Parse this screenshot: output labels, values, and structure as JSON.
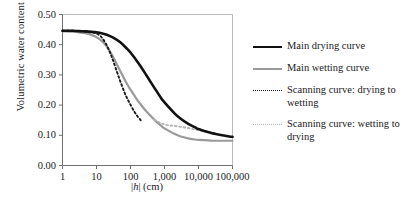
{
  "chart_data": {
    "type": "line",
    "title": "",
    "xlabel": "|h| (cm)",
    "ylabel": "Volumetric water content (–)",
    "x_scale": "log",
    "xlim": [
      1,
      100000
    ],
    "ylim": [
      0.0,
      0.5
    ],
    "grid": false,
    "legend_position": "right",
    "x_ticks": [
      "1",
      "10",
      "100",
      "1,000",
      "10,000",
      "100,000"
    ],
    "x_tick_values": [
      1,
      10,
      100,
      1000,
      10000,
      100000
    ],
    "y_ticks": [
      "0.00",
      "0.10",
      "0.20",
      "0.30",
      "0.40",
      "0.50"
    ],
    "y_tick_values": [
      0.0,
      0.1,
      0.2,
      0.3,
      0.4,
      0.5
    ],
    "series": [
      {
        "name": "Main drying curve",
        "style": "solid",
        "color": "#111111",
        "width": 2.6,
        "x": [
          1,
          2,
          3,
          5,
          8,
          10,
          15,
          20,
          30,
          50,
          80,
          100,
          150,
          200,
          300,
          500,
          800,
          1000,
          2000,
          3000,
          5000,
          8000,
          10000,
          20000,
          30000,
          50000,
          80000,
          100000
        ],
        "y": [
          0.446,
          0.446,
          0.445,
          0.444,
          0.442,
          0.441,
          0.437,
          0.433,
          0.424,
          0.408,
          0.386,
          0.374,
          0.348,
          0.328,
          0.297,
          0.258,
          0.223,
          0.209,
          0.172,
          0.155,
          0.138,
          0.126,
          0.121,
          0.11,
          0.105,
          0.1,
          0.096,
          0.095
        ]
      },
      {
        "name": "Main wetting curve",
        "style": "solid",
        "color": "#9a9a9a",
        "width": 2.2,
        "x": [
          1,
          2,
          3,
          5,
          8,
          10,
          15,
          20,
          30,
          50,
          80,
          100,
          150,
          200,
          300,
          500,
          800,
          1000,
          2000,
          3000,
          5000,
          8000,
          10000,
          20000,
          30000,
          50000,
          80000,
          100000
        ],
        "y": [
          0.444,
          0.443,
          0.441,
          0.437,
          0.43,
          0.425,
          0.41,
          0.394,
          0.362,
          0.313,
          0.269,
          0.251,
          0.221,
          0.202,
          0.178,
          0.152,
          0.131,
          0.123,
          0.104,
          0.096,
          0.09,
          0.086,
          0.085,
          0.083,
          0.082,
          0.082,
          0.082,
          0.082
        ]
      },
      {
        "name": "Scanning curve: drying to wetting",
        "style": "dotted",
        "color": "#1a1a1a",
        "width": 1.9,
        "x": [
          1,
          2,
          3,
          5,
          8,
          10,
          12,
          15,
          20,
          25,
          30,
          40,
          50,
          65,
          80,
          100,
          130,
          160,
          200
        ],
        "y": [
          0.446,
          0.446,
          0.445,
          0.443,
          0.44,
          0.437,
          0.432,
          0.421,
          0.398,
          0.374,
          0.351,
          0.31,
          0.279,
          0.245,
          0.222,
          0.201,
          0.178,
          0.163,
          0.15
        ]
      },
      {
        "name": "Scanning curve: wetting to drying",
        "style": "dotted",
        "color": "#b5b5b5",
        "width": 1.9,
        "x": [
          500,
          700,
          1000,
          1400,
          2000,
          3000,
          4000,
          6000,
          8000,
          10000,
          15000,
          20000,
          30000
        ],
        "y": [
          0.152,
          0.143,
          0.136,
          0.133,
          0.131,
          0.128,
          0.126,
          0.122,
          0.119,
          0.117,
          0.113,
          0.111,
          0.107
        ]
      }
    ]
  },
  "legend": {
    "entries": [
      {
        "label": "Main drying curve"
      },
      {
        "label": "Main wetting curve"
      },
      {
        "label": "Scanning curve: drying to wetting"
      },
      {
        "label": "Scanning curve: wetting to drying"
      }
    ]
  }
}
